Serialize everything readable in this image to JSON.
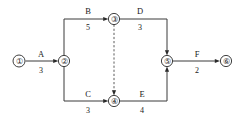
{
  "diagram": {
    "type": "activity-on-arrow-network",
    "title": "",
    "background_color": "#ffffff",
    "line_color": "#3a3a3a",
    "text_color": "#1a1a1a",
    "nodes": [
      {
        "id": "1",
        "label": "①",
        "x": 19,
        "y": 61,
        "r": 6.0
      },
      {
        "id": "2",
        "label": "②",
        "x": 64,
        "y": 61,
        "r": 5.6
      },
      {
        "id": "3",
        "label": "③",
        "x": 114,
        "y": 19,
        "r": 5.6
      },
      {
        "id": "4",
        "label": "④",
        "x": 114,
        "y": 101,
        "r": 5.6
      },
      {
        "id": "5",
        "label": "⑤",
        "x": 167,
        "y": 61,
        "r": 5.6
      },
      {
        "id": "6",
        "label": "⑥",
        "x": 226,
        "y": 61,
        "r": 5.6
      }
    ],
    "activities": [
      {
        "id": "A",
        "name": "A",
        "duration": "3",
        "from": "1",
        "to": "2",
        "name_x": 41,
        "name_y": 57,
        "dur_x": 41,
        "dur_y": 73
      },
      {
        "id": "B",
        "name": "B",
        "duration": "5",
        "from": "2",
        "to": "3",
        "name_x": 88,
        "name_y": 14,
        "dur_x": 88,
        "dur_y": 30
      },
      {
        "id": "C",
        "name": "C",
        "duration": "3",
        "from": "2",
        "to": "4",
        "name_x": 88,
        "name_y": 97,
        "dur_x": 88,
        "dur_y": 113
      },
      {
        "id": "D",
        "name": "D",
        "duration": "3",
        "from": "3",
        "to": "5",
        "name_x": 140,
        "name_y": 14,
        "dur_x": 140,
        "dur_y": 30
      },
      {
        "id": "E",
        "name": "E",
        "duration": "4",
        "from": "4",
        "to": "5",
        "name_x": 142,
        "name_y": 97,
        "dur_x": 142,
        "dur_y": 113
      },
      {
        "id": "F",
        "name": "F",
        "duration": "2",
        "from": "5",
        "to": "6",
        "name_x": 197,
        "name_y": 57,
        "dur_x": 197,
        "dur_y": 73
      }
    ],
    "dummy_activities": [
      {
        "id": "dummy-3-4",
        "from": "3",
        "to": "4",
        "style": "dashed",
        "name": "",
        "duration": ""
      }
    ]
  }
}
